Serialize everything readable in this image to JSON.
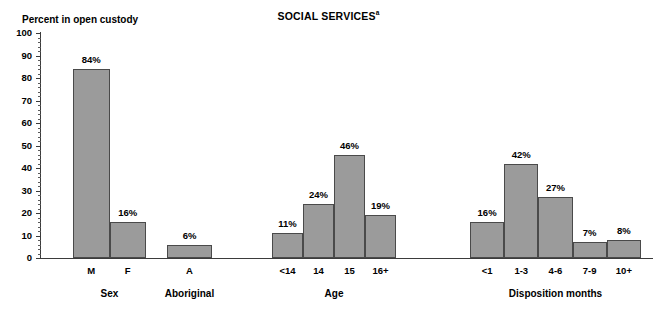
{
  "chart_data": {
    "type": "bar",
    "title": "SOCIAL SERVICES",
    "title_superscript": "a",
    "ylabel": "Percent in open custody",
    "xlabel": "",
    "ylim": [
      0,
      100
    ],
    "ytick_step": 10,
    "yticks": [
      "100",
      "90",
      "80",
      "70",
      "60",
      "50",
      "40",
      "30",
      "20",
      "10",
      "0"
    ],
    "grid": false,
    "legend": null,
    "value_suffix": "%",
    "bar_color": "#9b9b9b",
    "bar_border_color": "#4a4a4a",
    "axis_color": "#3b3b3b",
    "groups": [
      {
        "name": "Sex",
        "categories": [
          "M",
          "F"
        ],
        "values": [
          84,
          16
        ],
        "value_labels": [
          "84%",
          "16%"
        ]
      },
      {
        "name": "Aboriginal",
        "categories": [
          "A"
        ],
        "values": [
          6
        ],
        "value_labels": [
          "6%"
        ]
      },
      {
        "name": "Age",
        "categories": [
          "<14",
          "14",
          "15",
          "16+"
        ],
        "values": [
          11,
          24,
          46,
          19
        ],
        "value_labels": [
          "11%",
          "24%",
          "46%",
          "19%"
        ]
      },
      {
        "name": "Disposition months",
        "categories": [
          "<1",
          "1-3",
          "4-6",
          "7-9",
          "10+"
        ],
        "values": [
          16,
          42,
          27,
          7,
          8
        ],
        "value_labels": [
          "16%",
          "42%",
          "27%",
          "7%",
          "8%"
        ]
      }
    ]
  }
}
